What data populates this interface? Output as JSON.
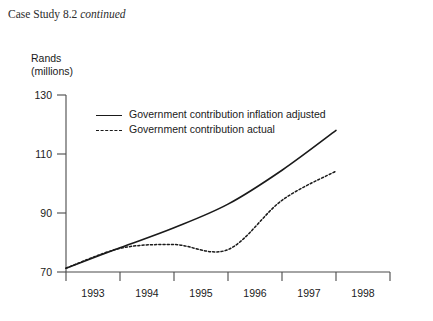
{
  "page": {
    "header_prefix": "Case Study 8.2 ",
    "header_emphasis": "continued"
  },
  "chart_data": {
    "type": "line",
    "title": "",
    "xlabel": "",
    "ylabel": "Rands (millions)",
    "ylabel_line1": "Rands",
    "ylabel_line2": "(millions)",
    "categories": [
      "1993",
      "1994",
      "1995",
      "1996",
      "1997",
      "1998"
    ],
    "x": [
      1993,
      1994,
      1995,
      1996,
      1997,
      1998
    ],
    "xlim": [
      1993,
      1999
    ],
    "ylim": [
      70,
      130
    ],
    "yticks": [
      70,
      90,
      110,
      130
    ],
    "ytick_labels": [
      "70",
      "90",
      "110",
      "130"
    ],
    "xticks": [
      1993,
      1994,
      1995,
      1996,
      1997,
      1998,
      1999
    ],
    "grid": false,
    "legend_position": "upper left inside",
    "series": [
      {
        "name": "Government contribution inflation adjusted",
        "style": "solid",
        "color": "#1a1a1a",
        "values": [
          71.3,
          78.2,
          85.0,
          93.0,
          104.5,
          118.0
        ]
      },
      {
        "name": "Government contribution actual",
        "style": "dashed",
        "color": "#1a1a1a",
        "values": [
          71.3,
          78.0,
          79.3,
          77.6,
          94.3,
          104.2
        ]
      }
    ]
  }
}
